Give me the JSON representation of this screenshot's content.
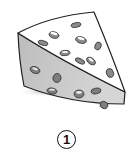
{
  "illustration": {
    "subject": "cheese-wedge",
    "colors": {
      "top_face": "#ffffff",
      "side_face": "#c9c9c9",
      "outline": "#222222",
      "hole_fill": "#8a8a8a",
      "hole_highlight": "#ffffff",
      "shadow": "#bdbdbd"
    }
  },
  "label": {
    "number": "1",
    "style": "circled"
  }
}
